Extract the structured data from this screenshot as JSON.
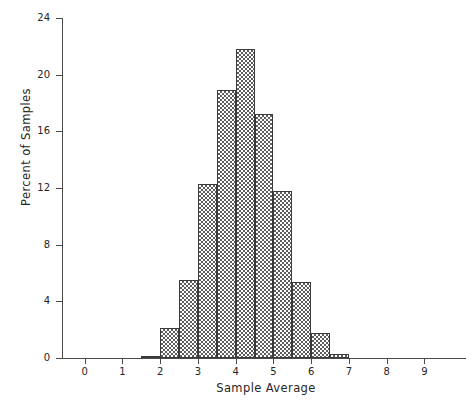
{
  "chart_data": {
    "type": "bar",
    "title": "",
    "subtitle": "",
    "xlabel": "Sample Average",
    "ylabel": "Percent of Samples",
    "xlim": [
      -0.6,
      10.1
    ],
    "ylim": [
      0,
      24
    ],
    "grid": false,
    "legend": null,
    "bin_width": 0.5,
    "xticks": [
      0,
      1,
      2,
      3,
      4,
      5,
      6,
      7,
      8,
      9
    ],
    "xtick_labels": [
      "0",
      "1",
      "2",
      "3",
      "4",
      "5",
      "6",
      "7",
      "8",
      "9"
    ],
    "yticks": [
      0,
      4,
      8,
      12,
      16,
      20,
      24
    ],
    "ytick_labels": [
      "0",
      "4",
      "8",
      "12",
      "16",
      "20",
      "24"
    ],
    "bins": [
      {
        "left": 1.5,
        "right": 2.0,
        "center": 1.75,
        "value": 0.1
      },
      {
        "left": 2.0,
        "right": 2.5,
        "center": 2.25,
        "value": 2.1
      },
      {
        "left": 2.5,
        "right": 3.0,
        "center": 2.75,
        "value": 5.5
      },
      {
        "left": 3.0,
        "right": 3.5,
        "center": 3.25,
        "value": 12.3
      },
      {
        "left": 3.5,
        "right": 4.0,
        "center": 3.75,
        "value": 18.9
      },
      {
        "left": 4.0,
        "right": 4.5,
        "center": 4.25,
        "value": 21.8
      },
      {
        "left": 4.5,
        "right": 5.0,
        "center": 4.75,
        "value": 17.2
      },
      {
        "left": 5.0,
        "right": 5.5,
        "center": 5.25,
        "value": 11.8
      },
      {
        "left": 5.5,
        "right": 6.0,
        "center": 5.75,
        "value": 5.4
      },
      {
        "left": 6.0,
        "right": 6.5,
        "center": 6.25,
        "value": 1.8
      },
      {
        "left": 6.5,
        "right": 7.0,
        "center": 6.75,
        "value": 0.3
      }
    ],
    "categories": [
      "1.75",
      "2.25",
      "2.75",
      "3.25",
      "3.75",
      "4.25",
      "4.75",
      "5.25",
      "5.75",
      "6.25",
      "6.75"
    ],
    "values": [
      0.1,
      2.1,
      5.5,
      12.3,
      18.9,
      21.8,
      17.2,
      11.8,
      5.4,
      1.8,
      0.3
    ],
    "colors": {
      "bar_fill": "#5d5d5d",
      "bar_edge": "#3a3a3a",
      "axis": "#4a4a4a",
      "text": "#262626",
      "background": "#ffffff"
    }
  }
}
